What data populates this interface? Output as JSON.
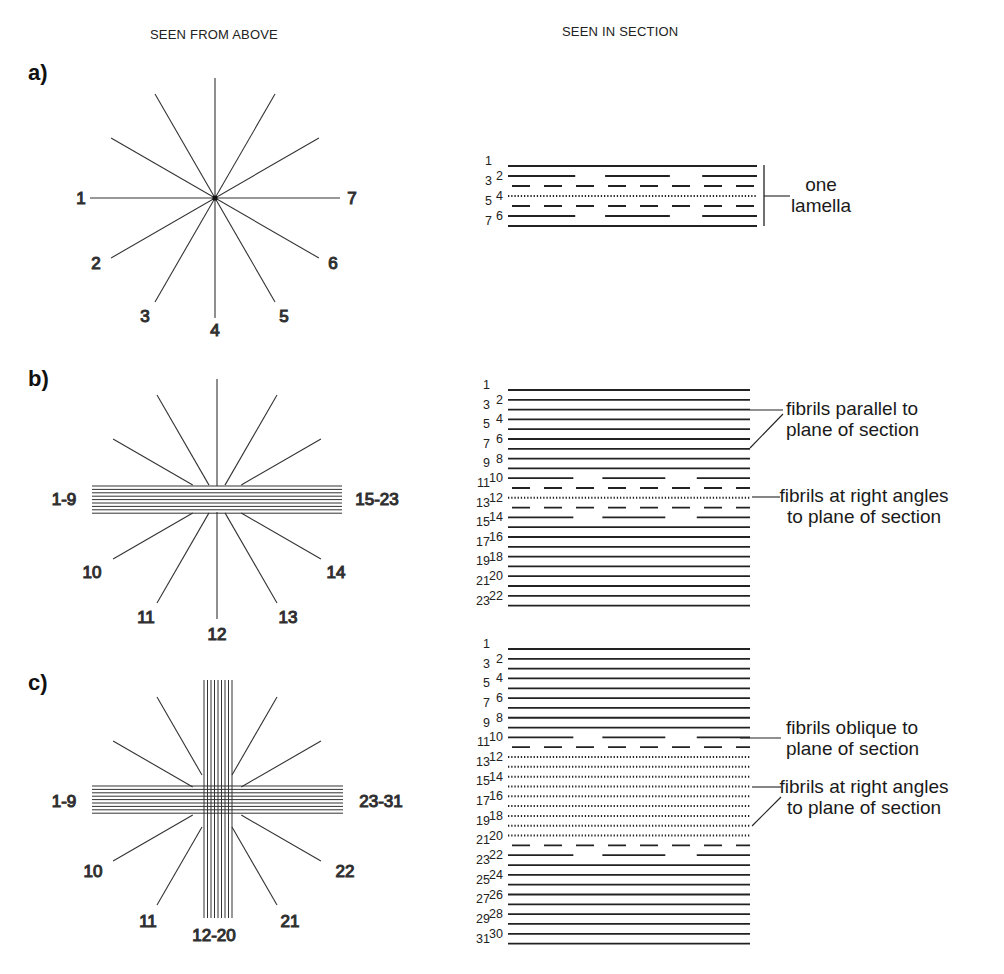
{
  "headers": {
    "left": "SEEN FROM ABOVE",
    "right": "SEEN IN SECTION"
  },
  "panels": [
    {
      "label": "a)",
      "above": {
        "type": "single-star",
        "line_labels": [
          "1",
          "2",
          "3",
          "4",
          "5",
          "6",
          "7"
        ]
      },
      "section": {
        "layers": 7,
        "layer_styles": [
          "solid",
          "long-dash",
          "dash",
          "dotted",
          "dash",
          "long-dash",
          "solid"
        ],
        "annotations": [
          {
            "text_line1": "one",
            "text_line2": "lamella"
          }
        ]
      }
    },
    {
      "label": "b)",
      "above": {
        "type": "star-with-horizontal-band",
        "band_left_label": "1-9",
        "band_right_label": "15-23",
        "line_labels": [
          "10",
          "11",
          "12",
          "13",
          "14"
        ]
      },
      "section": {
        "layers": 23,
        "annotations": [
          {
            "text_line1": "fibrils parallel to",
            "text_line2": "plane of section"
          },
          {
            "text_line1": "fibrils at right angles",
            "text_line2": "to plane of section"
          }
        ]
      }
    },
    {
      "label": "c)",
      "above": {
        "type": "star-with-cross-bands",
        "band_left_label": "1-9",
        "band_right_label": "23-31",
        "band_bottom_label": "12-20",
        "line_labels": [
          "10",
          "11",
          "21",
          "22"
        ]
      },
      "section": {
        "layers": 31,
        "annotations": [
          {
            "text_line1": "fibrils oblique to",
            "text_line2": "plane of section"
          },
          {
            "text_line1": "fibrils at right angles",
            "text_line2": "to plane of section"
          }
        ]
      }
    }
  ]
}
